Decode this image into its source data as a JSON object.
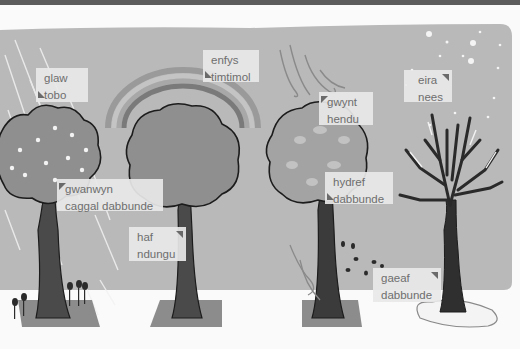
{
  "colors": {
    "sky": "#b9b9b9",
    "ground": "#fafafa",
    "foliage": "#8f8f8f",
    "trunk": "#3e3e3e",
    "label_bg": "#e8e8e8",
    "label_text": "#6e6e6e",
    "topbar": "#5c5c5c"
  },
  "labels": [
    {
      "id": "rain",
      "welsh": "glaw",
      "other": "tobo"
    },
    {
      "id": "rainbow",
      "welsh": "enfys",
      "other": "timtimol"
    },
    {
      "id": "wind",
      "welsh": "gwynt",
      "other": "hendu"
    },
    {
      "id": "snow",
      "welsh": "eira",
      "other": "nees"
    },
    {
      "id": "spring",
      "welsh": "gwanwyn",
      "other": "caggal dabbunde"
    },
    {
      "id": "summer",
      "welsh": "haf",
      "other": "ndungu"
    },
    {
      "id": "autumn",
      "welsh": "hydref",
      "other": "dabbunde"
    },
    {
      "id": "winter",
      "welsh": "gaeaf",
      "other": "dabbunde"
    }
  ],
  "trees": [
    {
      "season": "spring",
      "icon": "blossom-tree-icon"
    },
    {
      "season": "summer",
      "icon": "leafy-tree-icon"
    },
    {
      "season": "autumn",
      "icon": "autumn-tree-icon"
    },
    {
      "season": "winter",
      "icon": "bare-tree-icon"
    }
  ]
}
